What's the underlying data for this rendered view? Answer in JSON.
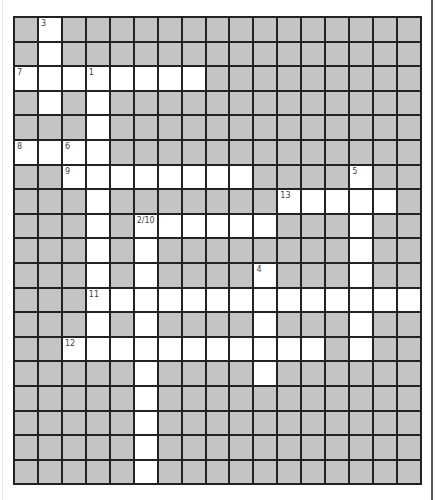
{
  "page": {
    "top_fragment": "˙˙˙",
    "colors": {
      "block": "#c4c4c4",
      "open": "#ffffff",
      "line": "#222222",
      "number": "#444444"
    }
  },
  "crossword": {
    "rows": 19,
    "cols": 17,
    "open_cells": [
      [
        0,
        1
      ],
      [
        1,
        1
      ],
      [
        2,
        0
      ],
      [
        2,
        1
      ],
      [
        2,
        2
      ],
      [
        2,
        3
      ],
      [
        2,
        4
      ],
      [
        2,
        5
      ],
      [
        2,
        6
      ],
      [
        2,
        7
      ],
      [
        3,
        1
      ],
      [
        3,
        3
      ],
      [
        4,
        3
      ],
      [
        5,
        0
      ],
      [
        5,
        1
      ],
      [
        5,
        2
      ],
      [
        5,
        3
      ],
      [
        6,
        2
      ],
      [
        6,
        3
      ],
      [
        6,
        4
      ],
      [
        6,
        5
      ],
      [
        6,
        6
      ],
      [
        6,
        7
      ],
      [
        6,
        8
      ],
      [
        6,
        9
      ],
      [
        6,
        14
      ],
      [
        7,
        3
      ],
      [
        7,
        11
      ],
      [
        7,
        12
      ],
      [
        7,
        13
      ],
      [
        7,
        14
      ],
      [
        7,
        15
      ],
      [
        8,
        3
      ],
      [
        8,
        5
      ],
      [
        8,
        6
      ],
      [
        8,
        7
      ],
      [
        8,
        8
      ],
      [
        8,
        9
      ],
      [
        8,
        10
      ],
      [
        8,
        14
      ],
      [
        9,
        3
      ],
      [
        9,
        5
      ],
      [
        9,
        14
      ],
      [
        10,
        3
      ],
      [
        10,
        5
      ],
      [
        10,
        10
      ],
      [
        10,
        14
      ],
      [
        11,
        3
      ],
      [
        11,
        4
      ],
      [
        11,
        5
      ],
      [
        11,
        6
      ],
      [
        11,
        7
      ],
      [
        11,
        8
      ],
      [
        11,
        9
      ],
      [
        11,
        10
      ],
      [
        11,
        11
      ],
      [
        11,
        12
      ],
      [
        11,
        13
      ],
      [
        11,
        14
      ],
      [
        11,
        15
      ],
      [
        11,
        16
      ],
      [
        12,
        3
      ],
      [
        12,
        5
      ],
      [
        12,
        10
      ],
      [
        12,
        14
      ],
      [
        13,
        2
      ],
      [
        13,
        3
      ],
      [
        13,
        4
      ],
      [
        13,
        5
      ],
      [
        13,
        6
      ],
      [
        13,
        7
      ],
      [
        13,
        8
      ],
      [
        13,
        9
      ],
      [
        13,
        10
      ],
      [
        13,
        11
      ],
      [
        13,
        12
      ],
      [
        13,
        14
      ],
      [
        14,
        5
      ],
      [
        14,
        10
      ],
      [
        15,
        5
      ],
      [
        16,
        5
      ],
      [
        17,
        5
      ],
      [
        18,
        5
      ]
    ],
    "numbers": [
      {
        "row": 0,
        "col": 1,
        "label": "3"
      },
      {
        "row": 2,
        "col": 0,
        "label": "7"
      },
      {
        "row": 2,
        "col": 3,
        "label": "1"
      },
      {
        "row": 5,
        "col": 0,
        "label": "8"
      },
      {
        "row": 5,
        "col": 2,
        "label": "6"
      },
      {
        "row": 6,
        "col": 2,
        "label": "9"
      },
      {
        "row": 6,
        "col": 14,
        "label": "5"
      },
      {
        "row": 7,
        "col": 11,
        "label": "13"
      },
      {
        "row": 8,
        "col": 5,
        "label": "2/10"
      },
      {
        "row": 10,
        "col": 10,
        "label": "4"
      },
      {
        "row": 11,
        "col": 3,
        "label": "11"
      },
      {
        "row": 13,
        "col": 2,
        "label": "12"
      }
    ]
  }
}
